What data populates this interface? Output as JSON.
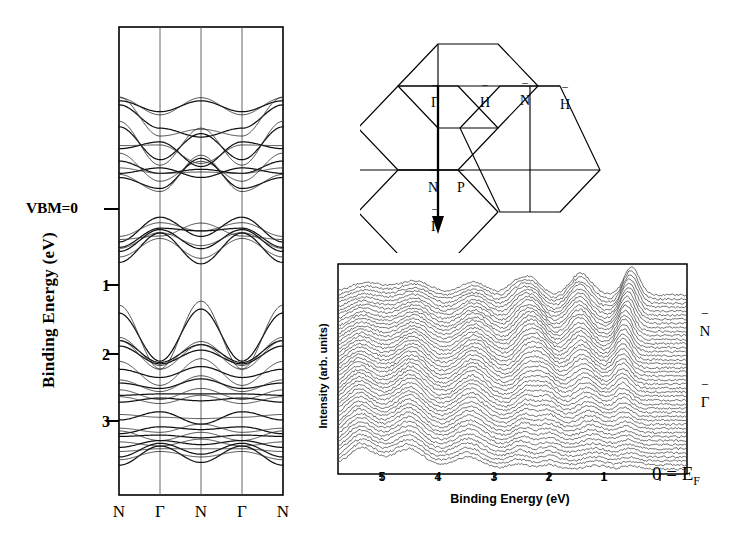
{
  "figure": {
    "kind": "scientific-figure"
  },
  "band_panel": {
    "ylabel": "Binding Energy (eV)",
    "vbm_label": "VBM=0",
    "ytick_labels": [
      "1",
      "2",
      "3"
    ],
    "xtick_labels": [
      "N",
      "Γ",
      "N",
      "Γ",
      "N"
    ],
    "frame_color": "#000000"
  },
  "bz_panel": {
    "labels": [
      {
        "text": "Γ",
        "bar": true
      },
      {
        "text": "H",
        "bar": true
      },
      {
        "text": "N",
        "bar": true
      },
      {
        "text": "H",
        "bar": true
      },
      {
        "text": "N",
        "bar": true
      },
      {
        "text": "P",
        "bar": true
      },
      {
        "text": "Γ",
        "bar": true
      }
    ],
    "line_color": "#000000"
  },
  "edc_panel": {
    "ylabel": "Intensity (arb. units)",
    "xlabel": "Binding Energy (eV)",
    "xtick_labels": [
      "5",
      "4",
      "3",
      "2",
      "1",
      "0"
    ],
    "fermi_label": "0 = E",
    "fermi_sub": "F",
    "k_labels": [
      {
        "text": "N",
        "bar": true
      },
      {
        "text": "Γ",
        "bar": true
      }
    ]
  },
  "chart_data": [
    {
      "type": "line",
      "name": "band-structure",
      "title": "",
      "xlabel": "",
      "ylabel": "Binding Energy (eV)",
      "ylim": [
        -1.6,
        3.85
      ],
      "yticks": [
        0,
        1,
        2,
        3
      ],
      "ytick_labels": [
        "VBM=0",
        "1",
        "2",
        "3"
      ],
      "y_direction": "inverted-binding-energy",
      "x_symmetry_points": [
        "N",
        "Γ",
        "N",
        "Γ",
        "N"
      ],
      "x_positions": [
        0,
        1,
        2,
        3,
        4
      ],
      "grid": "vertical-only",
      "note": "Energies in eV below the valence band maximum (VBM=0). Dispersions sampled at the five symmetry points N-Gamma-N-Gamma-N.",
      "series": [
        {
          "name": "c6",
          "values": [
            -1.58,
            -1.42,
            -1.58,
            -1.42,
            -1.58
          ]
        },
        {
          "name": "c5",
          "values": [
            -1.52,
            -1.18,
            -1.05,
            -1.18,
            -1.52
          ]
        },
        {
          "name": "c4",
          "values": [
            -1.2,
            -0.72,
            -1.1,
            -0.72,
            -1.2
          ]
        },
        {
          "name": "c3",
          "values": [
            -0.88,
            -0.98,
            -0.62,
            -0.98,
            -0.88
          ]
        },
        {
          "name": "c2",
          "values": [
            -0.7,
            -0.52,
            -0.58,
            -0.52,
            -0.7
          ]
        },
        {
          "name": "c1",
          "values": [
            -0.52,
            -0.6,
            -0.46,
            -0.6,
            -0.52
          ]
        },
        {
          "name": "c0",
          "values": [
            -0.46,
            -0.3,
            -0.74,
            -0.3,
            -0.46
          ]
        },
        {
          "name": "v1",
          "values": [
            0.48,
            0.12,
            0.4,
            0.12,
            0.48
          ]
        },
        {
          "name": "v2",
          "values": [
            0.56,
            0.28,
            0.32,
            0.28,
            0.56
          ]
        },
        {
          "name": "v3",
          "values": [
            0.62,
            0.3,
            0.58,
            0.3,
            0.62
          ]
        },
        {
          "name": "v4",
          "values": [
            0.78,
            0.35,
            0.8,
            0.35,
            0.78
          ]
        },
        {
          "name": "v5",
          "values": [
            1.52,
            2.22,
            1.46,
            2.22,
            1.52
          ]
        },
        {
          "name": "v6",
          "values": [
            1.92,
            2.24,
            1.98,
            2.24,
            1.92
          ]
        },
        {
          "name": "v7",
          "values": [
            2.0,
            2.26,
            2.06,
            2.26,
            2.0
          ]
        },
        {
          "name": "v8",
          "values": [
            2.34,
            2.46,
            2.3,
            2.46,
            2.34
          ]
        },
        {
          "name": "v9",
          "values": [
            2.54,
            2.62,
            2.48,
            2.62,
            2.54
          ]
        },
        {
          "name": "v10",
          "values": [
            2.72,
            2.7,
            2.7,
            2.7,
            2.72
          ]
        },
        {
          "name": "v11",
          "values": [
            2.82,
            2.76,
            2.8,
            2.76,
            2.82
          ]
        },
        {
          "name": "v12",
          "values": [
            3.08,
            2.96,
            3.14,
            2.96,
            3.08
          ]
        },
        {
          "name": "v13",
          "values": [
            3.28,
            3.18,
            3.22,
            3.18,
            3.28
          ]
        },
        {
          "name": "v14",
          "values": [
            3.32,
            3.3,
            3.34,
            3.3,
            3.32
          ]
        },
        {
          "name": "v15",
          "values": [
            3.48,
            3.38,
            3.44,
            3.38,
            3.48
          ]
        },
        {
          "name": "v16",
          "values": [
            3.62,
            3.42,
            3.58,
            3.42,
            3.62
          ]
        },
        {
          "name": "v17",
          "values": [
            3.74,
            3.46,
            3.7,
            3.46,
            3.74
          ]
        }
      ]
    },
    {
      "type": "line",
      "name": "edc-waterfall",
      "title": "",
      "xlabel": "Binding Energy (eV)",
      "ylabel": "Intensity (arb. units)",
      "xlim": [
        5.7,
        -0.35
      ],
      "xticks": [
        5,
        4,
        3,
        2,
        1,
        0
      ],
      "x_direction": "reversed",
      "n_curves": 44,
      "k_axis_labels": [
        "N̅",
        "Γ̅"
      ],
      "grid": "none",
      "note": "Stacked energy distribution curves (EDCs) measured between the surface symmetry points N-bar and Gamma-bar; binding energy referenced to the Fermi level E_F at 0 eV.",
      "peak_positions_eV": [
        0.6,
        1.35,
        2.2,
        2.6,
        3.4,
        4.4,
        5.3
      ],
      "curve_baseline_offset": 1.0
    }
  ]
}
